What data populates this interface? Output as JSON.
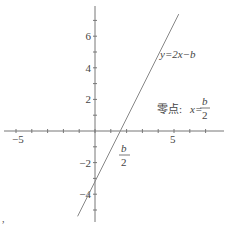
{
  "chart_data": {
    "type": "line",
    "title": "",
    "xlabel": "",
    "ylabel": "",
    "xlim": [
      -6,
      8
    ],
    "ylim": [
      -5.5,
      8
    ],
    "x_ticks": [
      -5,
      -4,
      -3,
      -2,
      -1,
      0,
      1,
      2,
      3,
      4,
      5,
      6,
      7
    ],
    "x_tick_labels": [
      {
        "value": -5,
        "label": "−5"
      },
      {
        "value": 5,
        "label": "5"
      }
    ],
    "y_ticks": [
      -5,
      -4,
      -3,
      -2,
      -1,
      1,
      2,
      3,
      4,
      5,
      6,
      7
    ],
    "y_tick_labels": [
      {
        "value": 6,
        "label": "6"
      },
      {
        "value": 4,
        "label": "4"
      },
      {
        "value": 2,
        "label": "2"
      },
      {
        "value": -2,
        "label": "−2"
      },
      {
        "value": -4,
        "label": "−4"
      }
    ],
    "series": [
      {
        "name": "y=2x−b",
        "slope": 2,
        "intercept": -3.2,
        "x_range": [
          -1.1,
          5.3
        ]
      }
    ],
    "annotations": {
      "line_label": "y=2x−b",
      "zero_label_prefix": "零点:",
      "zero_label_var": "x=",
      "frac_num": "b",
      "frac_den": "2",
      "stray_mark": ","
    }
  }
}
